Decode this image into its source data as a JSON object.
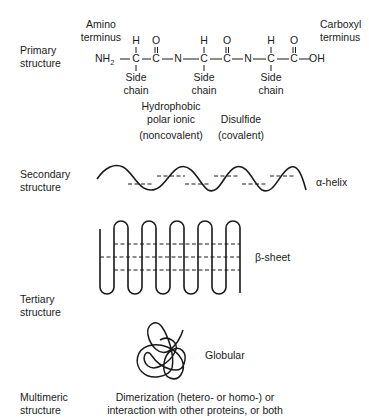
{
  "levels": {
    "primary": {
      "label_line1": "Primary",
      "label_line2": "structure"
    },
    "secondary": {
      "label_line1": "Secondary",
      "label_line2": "structure"
    },
    "tertiary": {
      "label_line1": "Tertiary",
      "label_line2": "structure"
    },
    "multimeric": {
      "label_line1": "Multimeric",
      "label_line2": "structure"
    }
  },
  "primary_chain": {
    "amino_terminus_line1": "Amino",
    "amino_terminus_line2": "terminus",
    "carboxyl_terminus_line1": "Carboxyl",
    "carboxyl_terminus_line2": "terminus",
    "nh2": "NH",
    "nh2_sub": "2",
    "atoms": {
      "h": "H",
      "o": "O",
      "c": "C",
      "n": "N",
      "oh": "OH"
    },
    "side_chain_line1": "Side",
    "side_chain_line2": "chain",
    "bond": "—"
  },
  "bond_types": {
    "noncovalent_line1": "Hydrophobic",
    "noncovalent_line2": "polar ionic",
    "noncovalent_line3": "(noncovalent)",
    "covalent_line1": "Disulfide",
    "covalent_line2": "(covalent)"
  },
  "secondary": {
    "alpha_helix_label": "α-helix",
    "beta_sheet_label": "β-sheet"
  },
  "tertiary": {
    "globular_label": "Globular"
  },
  "multimeric": {
    "description_line1": "Dimerization (hetero- or homo-) or",
    "description_line2": "interaction with other proteins, or both"
  },
  "colors": {
    "ink": "#1a1a1a",
    "background": "#ffffff"
  }
}
